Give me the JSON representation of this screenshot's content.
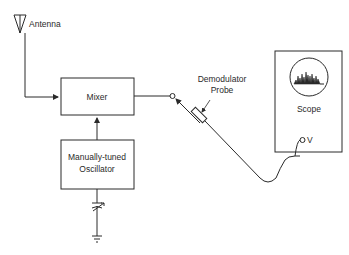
{
  "diagram": {
    "antenna": {
      "label": "Antenna"
    },
    "mixer": {
      "label": "Mixer"
    },
    "oscillator": {
      "label_line1": "Manually-tuned",
      "label_line2": "Oscillator"
    },
    "probe": {
      "label_line1": "Demodulator",
      "label_line2": "Probe"
    },
    "scope": {
      "label": "Scope",
      "input_label": "V"
    },
    "colors": {
      "line": "#2a2a2a",
      "background": "#ffffff"
    }
  }
}
